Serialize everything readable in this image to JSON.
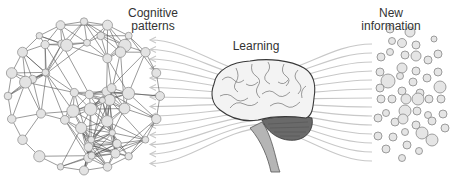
{
  "diagram": {
    "labels": {
      "cognitive_patterns": "Cognitive patterns",
      "cognitive_line1": "Cognitive",
      "cognitive_line2": "patterns",
      "learning": "Learning",
      "new_information_line1": "New",
      "new_information_line2": "information"
    },
    "elements": {
      "left": "network-graph (interconnected nodes)",
      "center": "brain (side view)",
      "right": "scattered circles (unconnected nodes)",
      "flow": "curved gray lines with arrowheads pointing left, passing through the brain"
    },
    "colors": {
      "node_fill": "#e3e3e3",
      "node_stroke": "#888888",
      "edge": "#555555",
      "flow_lines": "#c4c4c4",
      "brain_fill": "#f2f2f2",
      "brain_stroke": "#444444",
      "cerebellum": "#6e6e6e",
      "brainstem": "#b0b0b0",
      "text": "#333333"
    }
  }
}
